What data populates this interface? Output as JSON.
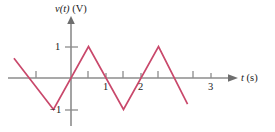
{
  "figure": {
    "background_color": "#ffffff",
    "axis_color": "#8c8c8c",
    "curve_color": "#c9486b",
    "text_color": "#1a1a1a"
  },
  "labels": {
    "y_axis_title": "v(t) (V)",
    "y_axis_title_var": "v(t)",
    "y_axis_title_unit": "(V)",
    "x_axis_title": "t (s)",
    "x_axis_title_var": "t",
    "x_axis_title_unit": "(s)",
    "x_tick_1": "1",
    "x_tick_2": "2",
    "x_tick_3": "3",
    "y_tick_pos1": "1",
    "y_tick_neg1": "−1"
  },
  "chart_data": {
    "type": "line",
    "title": "",
    "xlabel": "t (s)",
    "ylabel": "v(t) (V)",
    "xlim": [
      -1.6,
      4.4
    ],
    "ylim": [
      -1.45,
      1.45
    ],
    "xticks": [
      1,
      2,
      3
    ],
    "xticklabels": [
      "1",
      "2",
      "3"
    ],
    "yticks": [
      -1,
      1
    ],
    "yticklabels": [
      "−1",
      "1"
    ],
    "minor_xticks": [
      -1,
      0.5,
      1.5,
      2.5
    ],
    "grid": false,
    "legend": false,
    "waveform": "triangular",
    "period": 2.0,
    "amplitude": 1.0,
    "series": [
      {
        "name": "v(t)",
        "color": "#c9486b",
        "x": [
          -1.63,
          -0.5,
          0.5,
          1.5,
          2.5,
          3.33
        ],
        "y": [
          0.63,
          -1.0,
          1.0,
          -1.0,
          1.0,
          -0.83
        ]
      }
    ]
  }
}
